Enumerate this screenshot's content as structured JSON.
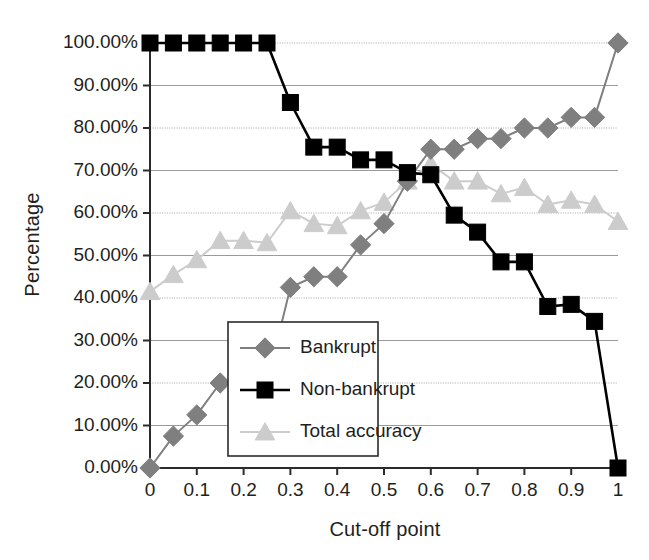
{
  "chart_data": {
    "type": "line",
    "title": "",
    "xlabel": "Cut-off point",
    "ylabel": "Percentage",
    "xlim": [
      0,
      1
    ],
    "ylim": [
      0,
      1
    ],
    "grid": true,
    "legend_position": "center",
    "x_tick_labels": [
      "0",
      "0.1",
      "0.2",
      "0.3",
      "0.4",
      "0.5",
      "0.6",
      "0.7",
      "0.8",
      "0.9",
      "1"
    ],
    "x_tick_values": [
      0,
      0.1,
      0.2,
      0.3,
      0.4,
      0.5,
      0.6,
      0.7,
      0.8,
      0.9,
      1
    ],
    "y_tick_labels": [
      "0.00%",
      "10.00%",
      "20.00%",
      "30.00%",
      "40.00%",
      "50.00%",
      "60.00%",
      "70.00%",
      "80.00%",
      "90.00%",
      "100.00%"
    ],
    "y_tick_values": [
      0,
      0.1,
      0.2,
      0.3,
      0.4,
      0.5,
      0.6,
      0.7,
      0.8,
      0.9,
      1
    ],
    "x": [
      0,
      0.05,
      0.1,
      0.15,
      0.2,
      0.25,
      0.3,
      0.35,
      0.4,
      0.45,
      0.5,
      0.55,
      0.6,
      0.65,
      0.7,
      0.75,
      0.8,
      0.85,
      0.9,
      0.95,
      1
    ],
    "series": [
      {
        "name": "Bankrupt",
        "color": "#7f7f7f",
        "marker": "diamond",
        "values": [
          0.0,
          0.075,
          0.125,
          0.2,
          0.2,
          0.2,
          0.425,
          0.45,
          0.45,
          0.525,
          0.575,
          0.675,
          0.75,
          0.75,
          0.775,
          0.775,
          0.8,
          0.8,
          0.825,
          0.825,
          1.0
        ]
      },
      {
        "name": "Non-bankrupt",
        "color": "#000000",
        "marker": "square",
        "values": [
          1.0,
          1.0,
          1.0,
          1.0,
          1.0,
          1.0,
          0.86,
          0.755,
          0.755,
          0.725,
          0.725,
          0.695,
          0.69,
          0.595,
          0.555,
          0.485,
          0.485,
          0.38,
          0.385,
          0.345,
          0.0
        ]
      },
      {
        "name": "Total accuracy",
        "color": "#cccccc",
        "marker": "triangle",
        "values": [
          0.415,
          0.455,
          0.49,
          0.535,
          0.535,
          0.53,
          0.605,
          0.575,
          0.57,
          0.605,
          0.625,
          0.675,
          0.715,
          0.675,
          0.675,
          0.645,
          0.66,
          0.62,
          0.63,
          0.62,
          0.58
        ]
      }
    ]
  },
  "legend": {
    "entries": [
      {
        "label": "Bankrupt"
      },
      {
        "label": "Non-bankrupt"
      },
      {
        "label": "Total accuracy"
      }
    ]
  },
  "axes": {
    "x_title": "Cut-off point",
    "y_title": "Percentage"
  }
}
